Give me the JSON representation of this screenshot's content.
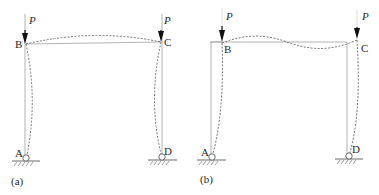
{
  "figure": {
    "panels": [
      {
        "id": "a",
        "caption": "(a)",
        "mode": "symmetric buckling",
        "loads": [
          {
            "label": "P",
            "node": "B"
          },
          {
            "label": "P",
            "node": "C"
          }
        ],
        "nodes": {
          "B": "B",
          "C": "C",
          "A": "A",
          "D": "D"
        },
        "supports": [
          "pin at A",
          "pin at D"
        ]
      },
      {
        "id": "b",
        "caption": "(b)",
        "mode": "antisymmetric (sway) buckling",
        "loads": [
          {
            "label": "P",
            "node": "B"
          },
          {
            "label": "P",
            "node": "C"
          }
        ],
        "nodes": {
          "B": "B",
          "C": "C",
          "A": "A",
          "D": "D"
        },
        "supports": [
          "pin at A",
          "pin at D"
        ]
      }
    ],
    "colors": {
      "member": "#9a9a9a",
      "deformed": "#666666",
      "arrow": "#111111",
      "text": "#2a2a2a"
    }
  }
}
